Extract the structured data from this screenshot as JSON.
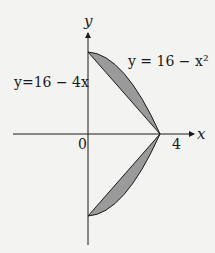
{
  "diagram": {
    "axes": {
      "x_label": "x",
      "y_label": "y",
      "origin_label": "0",
      "x_tick_label": "4"
    },
    "curves": {
      "line_label": "y=16 − 4x",
      "parabola_label": "y = 16 − x²"
    },
    "colors": {
      "background": "#f3f3f1",
      "shade": "#9a9a9a",
      "stroke": "#1a1a1a"
    }
  }
}
